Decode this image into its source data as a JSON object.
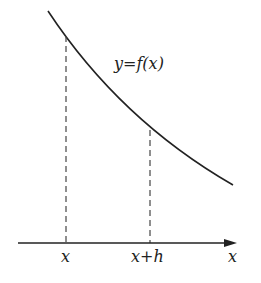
{
  "diagram": {
    "curve_label": "y=f(x)",
    "x_tick_label_1": "x",
    "x_tick_label_2": "x+h",
    "axis_label": "x",
    "colors": {
      "ink": "#222222",
      "background": "#ffffff"
    }
  }
}
